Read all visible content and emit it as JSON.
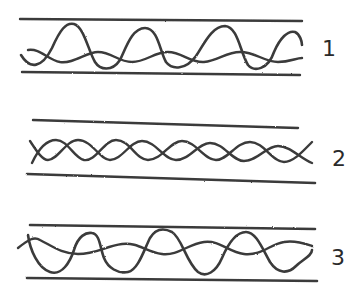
{
  "diagram": {
    "stroke_color": "#3a3a3a",
    "background_color": "#ffffff",
    "panels": [
      {
        "id": 1,
        "label": "1",
        "top_line": {
          "x1": 20,
          "y1": 19,
          "x2": 302,
          "y2": 21
        },
        "bottom_line": {
          "x1": 22,
          "y1": 72,
          "x2": 300,
          "y2": 75
        },
        "pattern": "large-amplitude wave crossing a smaller offset wave",
        "large_wave_path": "M21,55 C30,70 42,68 52,48 C60,30 66,22 74,24 C84,27 88,50 95,62 C100,70 112,72 120,60 C126,48 132,28 145,28 C158,28 160,52 166,62 C172,70 186,70 196,56 C204,44 212,26 225,26 C238,27 240,52 248,65 C254,72 268,70 274,52 C280,38 288,30 295,32 C300,34 302,42 302,45",
        "small_wave_path": "M28,50 C40,48 48,60 60,62 C74,64 86,52 98,52 C112,52 118,62 132,62 C146,62 154,52 168,52 C182,52 190,63 204,62 C218,61 226,52 240,52 C256,52 264,62 278,62 C290,62 296,58 302,58"
      },
      {
        "id": 2,
        "label": "2",
        "top_line": {
          "x1": 33,
          "y1": 120,
          "x2": 298,
          "y2": 128
        },
        "bottom_line": {
          "x1": 27,
          "y1": 174,
          "x2": 315,
          "y2": 183
        },
        "pattern": "two intertwined sine waves in antiphase forming a braid",
        "wave_a_path": "M30,141 C36,150 42,160 48,160 C58,160 66,140 78,140 C92,140 100,160 110,160 C122,160 130,141 142,141 C156,141 164,160 176,160 C190,160 198,143 210,143 C224,143 232,161 244,161 C258,161 266,146 278,146 C290,146 300,158 312,163",
        "wave_b_path": "M32,163 C38,150 46,140 56,140 C68,140 74,158 84,160 C96,162 104,140 116,140 C130,140 136,160 148,160 C162,160 170,141 182,141 C196,141 204,160 216,160 C228,160 236,142 250,142 C264,142 272,162 284,162 C294,162 304,150 312,142",
        "node_x": [
          40,
          83,
          127,
          178,
          228,
          272,
          310
        ]
      },
      {
        "id": 3,
        "label": "3",
        "top_line": {
          "x1": 30,
          "y1": 225,
          "x2": 315,
          "y2": 229
        },
        "bottom_line": {
          "x1": 27,
          "y1": 278,
          "x2": 317,
          "y2": 281
        },
        "pattern": "large-amplitude wave crossing a smaller offset wave, phase-shifted",
        "large_wave_path": "M28,235 C30,250 38,268 50,272 C62,276 70,262 74,250 C78,236 86,232 92,233 C100,234 100,248 104,258 C108,268 118,274 128,272 C138,270 144,250 150,238 C156,228 164,228 172,232 C182,238 186,262 198,272 C206,278 216,272 222,258 C228,244 236,232 246,232 C256,232 262,248 270,262 C278,274 288,274 296,266 C302,260 312,256 312,250",
        "small_wave_path": "M18,248 C28,240 34,236 40,240 C52,246 62,254 78,254 C96,254 106,246 122,244 C138,242 146,252 162,254 C178,256 188,244 204,242 C220,240 228,252 244,254 C262,256 270,244 284,242 C296,240 306,244 312,246"
      }
    ]
  }
}
